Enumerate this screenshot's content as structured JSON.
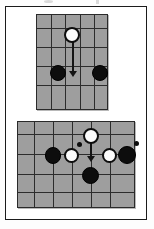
{
  "figure": {
    "title": "Two board-game move diagrams",
    "background_color": "#ffffff",
    "frame_color": "#1b1b1b",
    "board_fill": "#9e9e9e",
    "grid_color": "#2c2c2c",
    "black_stone_color": "#0d0d0d",
    "white_stone_color": "#fbfbfb",
    "arrow_color": "#141414"
  },
  "boards": [
    {
      "id": "upper-board",
      "label": "Upper diagram",
      "columns": 5,
      "rows": 5,
      "stones": [
        {
          "id": "u-white-1",
          "color": "white",
          "col": 3,
          "row": 2,
          "label": "white stone moving down"
        },
        {
          "id": "u-black-1",
          "color": "black",
          "col": 2,
          "row": 4,
          "label": "black stone left"
        },
        {
          "id": "u-black-2",
          "color": "black",
          "col": 4,
          "row": 4,
          "label": "black stone right"
        }
      ],
      "arrows": [
        {
          "id": "u-arrow-1",
          "from_col": 3,
          "from_row": 2,
          "to_col": 3,
          "to_row": 4,
          "direction": "down"
        }
      ],
      "markers": []
    },
    {
      "id": "lower-board",
      "label": "Lower diagram",
      "columns": 6,
      "rows": 4,
      "stones": [
        {
          "id": "l-white-1",
          "color": "white",
          "col": 4,
          "row": 1,
          "label": "white stone moving down"
        },
        {
          "id": "l-black-1",
          "color": "black",
          "col": 2,
          "row": 2,
          "label": "black stone far left"
        },
        {
          "id": "l-white-2",
          "color": "white",
          "col": 3,
          "row": 2,
          "label": "white stone left"
        },
        {
          "id": "l-white-3",
          "color": "white",
          "col": 5,
          "row": 2,
          "label": "white stone right"
        },
        {
          "id": "l-black-2",
          "color": "black",
          "col": 6,
          "row": 2,
          "label": "black stone far right"
        },
        {
          "id": "l-black-3",
          "color": "black",
          "col": 4,
          "row": 3,
          "label": "black stone below"
        }
      ],
      "arrows": [
        {
          "id": "l-arrow-1",
          "from_col": 4,
          "from_row": 1,
          "to_col": 4,
          "to_row": 2,
          "direction": "down"
        }
      ],
      "markers": [
        {
          "id": "l-marker-left",
          "col": 3.5,
          "row": 1.6,
          "label": "capture marker left"
        },
        {
          "id": "l-marker-right",
          "col": 6.5,
          "row": 1.6,
          "label": "capture marker right"
        }
      ]
    }
  ]
}
